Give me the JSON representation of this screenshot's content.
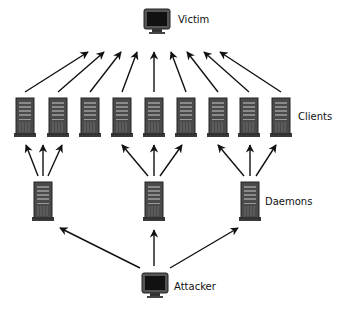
{
  "diagram": {
    "type": "ddos-topology",
    "labels": {
      "victim": "Victim",
      "clients": "Clients",
      "daemons": "Daemons",
      "attacker": "Attacker"
    },
    "nodes": {
      "victim": {
        "kind": "monitor-icon",
        "x": 157,
        "y": 20
      },
      "attacker": {
        "kind": "monitor-icon",
        "x": 155,
        "y": 284
      },
      "daemons": [
        {
          "kind": "server-icon",
          "x": 43,
          "y": 201
        },
        {
          "kind": "server-icon",
          "x": 154,
          "y": 201
        },
        {
          "kind": "server-icon",
          "x": 250,
          "y": 201
        }
      ],
      "clients": [
        {
          "kind": "server-icon",
          "x": 25,
          "y": 117
        },
        {
          "kind": "server-icon",
          "x": 58,
          "y": 117
        },
        {
          "kind": "server-icon",
          "x": 90,
          "y": 117
        },
        {
          "kind": "server-icon",
          "x": 122,
          "y": 117
        },
        {
          "kind": "server-icon",
          "x": 154,
          "y": 117
        },
        {
          "kind": "server-icon",
          "x": 186,
          "y": 117
        },
        {
          "kind": "server-icon",
          "x": 218,
          "y": 117
        },
        {
          "kind": "server-icon",
          "x": 249,
          "y": 117
        },
        {
          "kind": "server-icon",
          "x": 281,
          "y": 117
        }
      ]
    },
    "edges": {
      "attacker_to_daemons": true,
      "daemons_to_clients": [
        [
          0,
          0
        ],
        [
          0,
          1
        ],
        [
          0,
          2
        ],
        [
          1,
          3
        ],
        [
          1,
          4
        ],
        [
          1,
          5
        ],
        [
          2,
          6
        ],
        [
          2,
          7
        ],
        [
          2,
          8
        ]
      ],
      "clients_to_victim": true
    },
    "colors": {
      "arrow": "#111111",
      "server_body": "#4a4a4a",
      "server_dark": "#2a2a2a",
      "screen": "#111111"
    }
  }
}
